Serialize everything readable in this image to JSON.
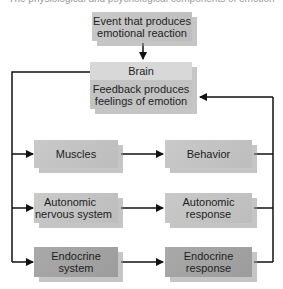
{
  "diagram": {
    "cut_top_text": "The physiological and psychological components of emotion",
    "event": {
      "line1": "Event that produces",
      "line2": "emotional reaction"
    },
    "brain": {
      "title": "Brain",
      "line1": "Feedback produces",
      "line2": "feelings of emotion"
    },
    "rows": [
      {
        "left": {
          "line1": "Muscles",
          "line2": ""
        },
        "right": {
          "line1": "Behavior",
          "line2": ""
        }
      },
      {
        "left": {
          "line1": "Autonomic",
          "line2": "nervous system"
        },
        "right": {
          "line1": "Autonomic",
          "line2": "response"
        }
      },
      {
        "left": {
          "line1": "Endocrine",
          "line2": "system"
        },
        "right": {
          "line1": "Endocrine",
          "line2": "response"
        }
      }
    ],
    "colors": {
      "light_box": "#c4c4c4",
      "dark_box": "#a3a3a3",
      "line": "#111111"
    }
  }
}
